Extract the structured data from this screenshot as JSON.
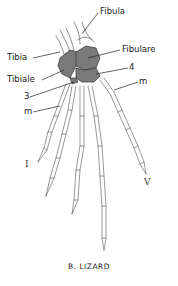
{
  "figure": {
    "caption": "B. LIZARD",
    "colors": {
      "tarsal_fill": "#7a7a7a",
      "line": "#333333",
      "bone_fill": "#ffffff"
    },
    "labels": {
      "fibula": "Fibula",
      "tibia": "Tibia",
      "fibulare": "Fibulare",
      "tibiale": "Tibiale",
      "four": "4",
      "three": "3",
      "m_right": "m",
      "m_left": "m",
      "digit_I": "I",
      "digit_V": "V"
    }
  }
}
